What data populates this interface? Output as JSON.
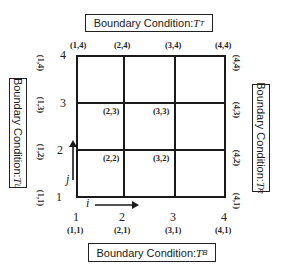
{
  "boundary": {
    "top": {
      "label": "Boundary Condition: ",
      "symbol": "T",
      "sub": "T"
    },
    "bottom": {
      "label": "Boundary Condition: ",
      "symbol": "T",
      "sub": "B"
    },
    "left": {
      "label": "Boundary Condition: ",
      "symbol": "T",
      "sub": "L"
    },
    "right": {
      "label": "Boundary Condition: ",
      "symbol": "T",
      "sub": "R"
    }
  },
  "grid": {
    "rows": 3,
    "cols": 3,
    "i_ticks": [
      "1",
      "2",
      "3",
      "4"
    ],
    "j_ticks": [
      "1",
      "2",
      "3",
      "4"
    ],
    "i_axis_label": "i",
    "j_axis_label": "j"
  },
  "node_labels": {
    "top": [
      "(1,4)",
      "(2,4)",
      "(3,4)",
      "(4,4)"
    ],
    "bottom": [
      "(1,1)",
      "(2,1)",
      "(3,1)",
      "(4,1)"
    ],
    "left": [
      "(1,4)",
      "(1,3)",
      "(1,2)",
      "(1,1)"
    ],
    "right": [
      "(4,4)",
      "(4,3)",
      "(4,2)",
      "(4,1)"
    ],
    "interior": [
      "(2,3)",
      "(3,3)",
      "(2,2)",
      "(3,2)"
    ]
  },
  "colors": {
    "line": "#1a1a1a",
    "background": "#ffffff"
  }
}
